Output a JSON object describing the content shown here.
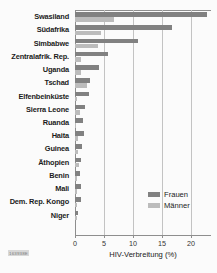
{
  "chart_data": {
    "type": "bar",
    "orientation": "horizontal",
    "title": "",
    "xlabel": "HIV-Verbreitung (%)",
    "ylabel": "",
    "xlim": [
      0,
      22.5
    ],
    "xticks": [
      0,
      5,
      10,
      15,
      20
    ],
    "xtick_labels": [
      "0",
      "5",
      "10",
      "15",
      "20"
    ],
    "grid": true,
    "grid_axis": "x",
    "legend_position": "inside-right-lower",
    "categories": [
      "Swasiland",
      "Südafrika",
      "Simbabwe",
      "Zentralafrik. Rep.",
      "Uganda",
      "Tschad",
      "Elfenbeinküste",
      "Sierra Leone",
      "Ruanda",
      "Haita",
      "Guinea",
      "Äthopien",
      "Benin",
      "Mali",
      "Dem. Rep. Kongo",
      "Niger"
    ],
    "series": [
      {
        "name": "Frauen",
        "color": "#818181",
        "values": [
          22.8,
          16.7,
          10.9,
          5.7,
          4.2,
          2.6,
          2.4,
          1.8,
          1.4,
          1.5,
          1.2,
          1.1,
          0.9,
          1.0,
          1.0,
          0.5
        ]
      },
      {
        "name": "Männer",
        "color": "#bcbcbc",
        "values": [
          6.7,
          4.4,
          4.0,
          1.0,
          1.1,
          2.0,
          0.3,
          0.9,
          0.2,
          0.6,
          0.6,
          0.7,
          0.3,
          0.4,
          0.4,
          0.3
        ]
      }
    ]
  },
  "legend": {
    "items": [
      {
        "label": "Frauen",
        "color": "#818181"
      },
      {
        "label": "Männer",
        "color": "#bcbcbc"
      }
    ]
  },
  "footer": {
    "id_code": "163938E"
  }
}
